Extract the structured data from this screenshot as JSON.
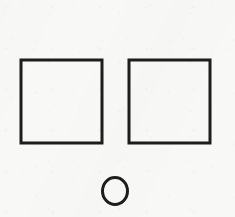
{
  "figure": {
    "background_color": "#f8f8f6",
    "stroke_color": "#1d1d1d",
    "canvas": {
      "width": 235,
      "height": 217
    },
    "shape_count": 3,
    "shapes": [
      {
        "id": "square-left",
        "name": "left-square",
        "type": "square",
        "label": "Left square",
        "x": 21,
        "y": 60,
        "width": 81,
        "height": 83,
        "stroke_width": 3,
        "fill": "none",
        "stroke_color": "#1d1d1d"
      },
      {
        "id": "square-right",
        "name": "right-square",
        "type": "square",
        "label": "Right square",
        "x": 129,
        "y": 60,
        "width": 81,
        "height": 83,
        "stroke_width": 3,
        "fill": "none",
        "stroke_color": "#1d1d1d"
      },
      {
        "id": "circle-bottom",
        "name": "bottom-circle",
        "type": "circle",
        "label": "Bottom circle",
        "cx": 115,
        "cy": 191,
        "rx": 12.5,
        "ry": 13.5,
        "stroke_width": 3,
        "fill": "none",
        "stroke_color": "#1d1d1d"
      }
    ],
    "gap_between_squares": 27
  }
}
